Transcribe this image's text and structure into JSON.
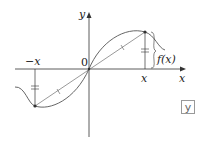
{
  "diagram": {
    "labels": {
      "y_axis": "y",
      "x_axis": "x",
      "origin": "0",
      "neg_x": "−x",
      "pos_x": "x",
      "f_x": "f(x)",
      "badge": "y"
    },
    "colors": {
      "stroke": "#333333",
      "curve": "#555555",
      "badge_border": "#999999"
    },
    "points": {
      "origin": [
        89,
        69
      ],
      "right_point": [
        145,
        32
      ],
      "left_point": [
        35,
        106
      ]
    }
  }
}
